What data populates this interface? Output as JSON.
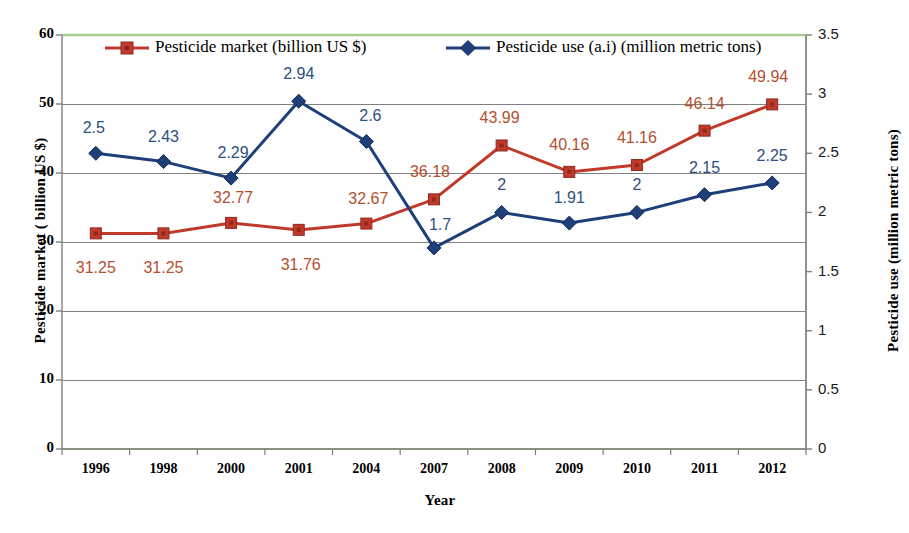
{
  "chart_data": {
    "type": "line",
    "title": "",
    "xlabel": "Year",
    "categories": [
      "1996",
      "1998",
      "2000",
      "2001",
      "2004",
      "2007",
      "2008",
      "2009",
      "2010",
      "2011",
      "2012"
    ],
    "grid": true,
    "legend_position": "top",
    "series": [
      {
        "name": "Pesticide market (billion US $)",
        "axis": "left",
        "color": "#c0392b",
        "marker": "square",
        "values": [
          31.25,
          31.25,
          32.77,
          31.76,
          32.67,
          36.18,
          43.99,
          40.16,
          41.16,
          46.14,
          49.94
        ],
        "labels": [
          "31.25",
          "31.25",
          "32.77",
          "31.76",
          "32.67",
          "36.18",
          "43.99",
          "40.16",
          "41.16",
          "46.14",
          "49.94"
        ]
      },
      {
        "name": "Pesticide use (a.i) (million metric tons)",
        "axis": "right",
        "color": "#1f3f7a",
        "marker": "diamond",
        "values": [
          2.5,
          2.43,
          2.29,
          2.94,
          2.6,
          1.7,
          2,
          1.91,
          2,
          2.15,
          2.25
        ],
        "labels": [
          "2.5",
          "2.43",
          "2.29",
          "2.94",
          "2.6",
          "1.7",
          "2",
          "1.91",
          "2",
          "2.15",
          "2.25"
        ]
      }
    ],
    "yaxis_left": {
      "label": "Pesticide market ( billion US $)",
      "ylim": [
        0,
        60
      ],
      "ticks": [
        "0",
        "10",
        "20",
        "30",
        "40",
        "50",
        "60"
      ]
    },
    "yaxis_right": {
      "label": "Pesticide use (million metric tons)",
      "ylim": [
        0,
        3.5
      ],
      "ticks": [
        "0",
        "0.5",
        "1",
        "1.5",
        "2",
        "2.5",
        "3",
        "3.5"
      ]
    }
  },
  "colors": {
    "market_series": "#c0392b",
    "use_series": "#1f3f7a",
    "market_label": "#b3502f",
    "use_label": "#2a5080",
    "grid": "#808080",
    "plot_border": "#a9cd8f",
    "axis_line": "#7f7f7f"
  }
}
